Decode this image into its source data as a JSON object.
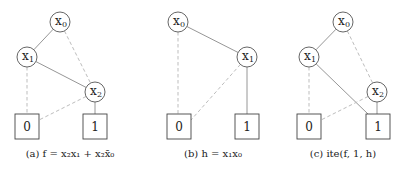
{
  "panels": [
    {
      "id": "a",
      "caption": "(a) f = x₂x₁ + x₂x̄₀",
      "nodes": [
        {
          "name": "x0",
          "label": "x",
          "sub": "0",
          "cx": 60,
          "cy": 22
        },
        {
          "name": "x1",
          "label": "x",
          "sub": "1",
          "cx": 27,
          "cy": 57
        },
        {
          "name": "x2",
          "label": "x",
          "sub": "2",
          "cx": 95,
          "cy": 92
        }
      ],
      "terminals": [
        {
          "name": "zero",
          "label": "0",
          "x": 15,
          "y": 114
        },
        {
          "name": "one",
          "label": "1",
          "x": 83,
          "y": 114
        }
      ],
      "edges": [
        {
          "from": "x0",
          "to": "x1",
          "type": "high"
        },
        {
          "from": "x0",
          "to": "x2",
          "type": "low"
        },
        {
          "from": "x1",
          "to": "x2",
          "type": "high"
        },
        {
          "from": "x1",
          "to": "zero",
          "type": "low"
        },
        {
          "from": "x2",
          "to": "zero",
          "type": "low"
        },
        {
          "from": "x2",
          "to": "one",
          "type": "high"
        }
      ]
    },
    {
      "id": "b",
      "caption": "(b) h = x₁x₀",
      "nodes": [
        {
          "name": "x0",
          "label": "x",
          "sub": "0",
          "cx": 178,
          "cy": 22
        },
        {
          "name": "x1",
          "label": "x",
          "sub": "1",
          "cx": 247,
          "cy": 57
        }
      ],
      "terminals": [
        {
          "name": "zero",
          "label": "0",
          "x": 167,
          "y": 114
        },
        {
          "name": "one",
          "label": "1",
          "x": 235,
          "y": 114
        }
      ],
      "edges": [
        {
          "from": "x0",
          "to": "x1",
          "type": "high"
        },
        {
          "from": "x0",
          "to": "zero",
          "type": "low"
        },
        {
          "from": "x1",
          "to": "zero",
          "type": "low"
        },
        {
          "from": "x1",
          "to": "one",
          "type": "high"
        }
      ]
    },
    {
      "id": "c",
      "caption": "(c) ite(f, 1, h)",
      "nodes": [
        {
          "name": "x0",
          "label": "x",
          "sub": "0",
          "cx": 343,
          "cy": 22
        },
        {
          "name": "x1",
          "label": "x",
          "sub": "1",
          "cx": 309,
          "cy": 57
        },
        {
          "name": "x2",
          "label": "x",
          "sub": "2",
          "cx": 377,
          "cy": 92
        }
      ],
      "terminals": [
        {
          "name": "zero",
          "label": "0",
          "x": 297,
          "y": 114
        },
        {
          "name": "one",
          "label": "1",
          "x": 366,
          "y": 114
        }
      ],
      "edges": [
        {
          "from": "x0",
          "to": "x1",
          "type": "high"
        },
        {
          "from": "x0",
          "to": "x2",
          "type": "low"
        },
        {
          "from": "x1",
          "to": "one",
          "type": "high"
        },
        {
          "from": "x1",
          "to": "zero",
          "type": "low"
        },
        {
          "from": "x2",
          "to": "zero",
          "type": "low"
        },
        {
          "from": "x2",
          "to": "one",
          "type": "high"
        }
      ]
    }
  ],
  "captions": {
    "a": "(a) f = x₂x₁ + x₂x̄₀",
    "b": "(b) h = x₁x₀",
    "c": "(c) ite(f, 1, h)"
  },
  "colors": {
    "node_stroke": "#555555",
    "high_edge": "#8a8a8a",
    "low_edge": "#bdbdbd",
    "text": "#222222"
  }
}
